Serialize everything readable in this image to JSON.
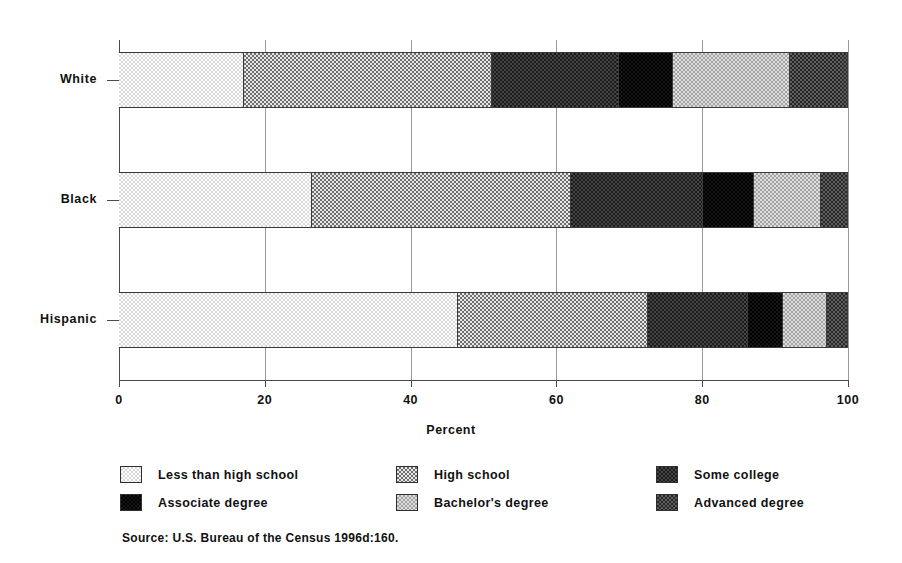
{
  "chart_data": {
    "type": "bar",
    "orientation": "horizontal",
    "stacked": true,
    "normalized": true,
    "title": "",
    "xlabel": "Percent",
    "ylabel": "",
    "xlim": [
      0,
      100
    ],
    "xticks": [
      0,
      20,
      40,
      60,
      80,
      100
    ],
    "xticklabels": [
      "0",
      "20",
      "40",
      "60",
      "80",
      "100"
    ],
    "grid": true,
    "legend_position": "below-axes",
    "categories": [
      "White",
      "Black",
      "Hispanic"
    ],
    "series": [
      {
        "name": "Less than high school",
        "key": "less",
        "values": [
          17.1,
          26.5,
          46.5
        ]
      },
      {
        "name": "High school",
        "key": "high",
        "values": [
          34.0,
          35.5,
          26.1
        ]
      },
      {
        "name": "Some college",
        "key": "some",
        "values": [
          17.5,
          18.1,
          13.7
        ]
      },
      {
        "name": "Associate degree",
        "key": "assoc",
        "values": [
          7.4,
          7.0,
          4.8
        ]
      },
      {
        "name": "Bachelor's degree",
        "key": "bach",
        "values": [
          16.0,
          9.2,
          6.0
        ]
      },
      {
        "name": "Advanced degree",
        "key": "adv",
        "values": [
          8.0,
          3.7,
          2.9
        ]
      }
    ],
    "source": "Source: U.S. Bureau of the Census 1996d:160."
  },
  "axis": {
    "x_title": "Percent",
    "x_tick_labels": [
      "0",
      "20",
      "40",
      "60",
      "80",
      "100"
    ],
    "y_tick_labels": [
      "White",
      "Black",
      "Hispanic"
    ]
  },
  "legend": {
    "items": [
      {
        "label": "Less than high school",
        "pattern": "pat-less"
      },
      {
        "label": "High school",
        "pattern": "pat-high"
      },
      {
        "label": "Some college",
        "pattern": "pat-some"
      },
      {
        "label": "Associate degree",
        "pattern": "pat-assoc"
      },
      {
        "label": "Bachelor's degree",
        "pattern": "pat-bach"
      },
      {
        "label": "Advanced degree",
        "pattern": "pat-adv"
      }
    ]
  },
  "footer": {
    "source": "Source: U.S. Bureau of the Census 1996d:160."
  }
}
